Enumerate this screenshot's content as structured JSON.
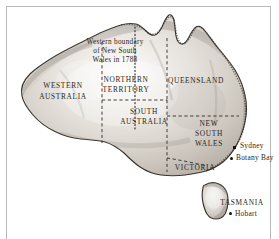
{
  "figure": {
    "background_color": "#ffffff",
    "frame_color": "#b9b9b9",
    "land_color": "#cfcac3",
    "coast_color": "#3b352d",
    "ink_color": "#2b2620",
    "border_style_states": "dashed",
    "border_style_1788": "dotted"
  },
  "annotation": {
    "line1": "Western boundary",
    "line2": "of New South",
    "line3": "Wales in 1788"
  },
  "states": [
    {
      "name": "WESTERN",
      "x": 63,
      "y": 86
    },
    {
      "name": "AUSTRALIA",
      "x": 63,
      "y": 97
    },
    {
      "name": "NORTHERN",
      "x": 126,
      "y": 80
    },
    {
      "name": "TERRITORY",
      "x": 126,
      "y": 90
    },
    {
      "name": "QUEENSLAND",
      "x": 196,
      "y": 81
    },
    {
      "name": "SOUTH",
      "x": 144,
      "y": 112
    },
    {
      "name": "AUSTRALIA",
      "x": 144,
      "y": 122
    },
    {
      "name": "NEW",
      "x": 209,
      "y": 124
    },
    {
      "name": "SOUTH",
      "x": 209,
      "y": 134
    },
    {
      "name": "WALES",
      "x": 209,
      "y": 144
    },
    {
      "name": "VICTORIA",
      "x": 195,
      "y": 168
    },
    {
      "name": "TASMANIA",
      "x": 242,
      "y": 203
    }
  ],
  "cities": [
    {
      "name": "Sydney",
      "marker": "square",
      "marker_x": 233,
      "marker_y": 146,
      "label_x": 240,
      "label_y": 142
    },
    {
      "name": "Botany Bay",
      "marker": "dot",
      "marker_x": 230,
      "marker_y": 157,
      "label_x": 236,
      "label_y": 154
    },
    {
      "name": "Hobart",
      "marker": "dot",
      "marker_x": 229,
      "marker_y": 212,
      "label_x": 235,
      "label_y": 210
    }
  ],
  "icons": {
    "sydney_marker": "square-marker-icon",
    "botany_bay_marker": "dot-marker-icon",
    "hobart_marker": "dot-marker-icon"
  }
}
